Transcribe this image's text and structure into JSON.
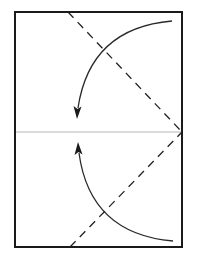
{
  "diagram": {
    "type": "origami-fold-instruction",
    "colors": {
      "background": "#ffffff",
      "outline": "#1a1a1a",
      "fold_line": "#222222",
      "center_crease": "#b5b5b5",
      "arrow": "#2a2a2a"
    },
    "paper": {
      "x": 15,
      "y": 12,
      "width": 167,
      "height": 235
    },
    "center_crease": {
      "x1": 15,
      "y1": 132,
      "x2": 182,
      "y2": 132
    },
    "valley_folds": [
      {
        "name": "upper-fold",
        "x1": 68,
        "y1": 12,
        "x2": 182,
        "y2": 132
      },
      {
        "name": "lower-fold",
        "x1": 70,
        "y1": 247,
        "x2": 182,
        "y2": 132
      }
    ],
    "arrows": [
      {
        "name": "upper-fold-arrow",
        "path": "M 172 21 Q 88 30 77 116",
        "tip": [
          77,
          118
        ],
        "dir": "down"
      },
      {
        "name": "lower-fold-arrow",
        "path": "M 173 241 Q 88 232 78 145",
        "tip": [
          78,
          143
        ],
        "dir": "up"
      }
    ]
  }
}
